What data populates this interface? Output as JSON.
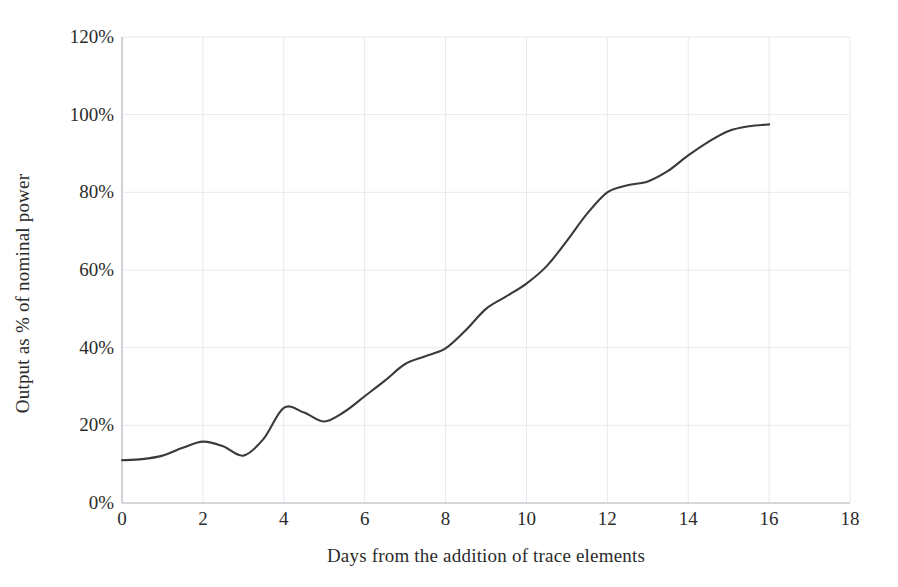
{
  "chart_data": {
    "type": "line",
    "title": "",
    "xlabel": "Days from the addition of trace elements",
    "ylabel": "Output as % of nominal power",
    "xlim": [
      0,
      18
    ],
    "ylim": [
      0,
      120
    ],
    "xticks": [
      "0",
      "2",
      "4",
      "6",
      "8",
      "10",
      "12",
      "14",
      "16",
      "18"
    ],
    "xtick_values": [
      0,
      2,
      4,
      6,
      8,
      10,
      12,
      14,
      16,
      18
    ],
    "yticks": [
      "0%",
      "20%",
      "40%",
      "60%",
      "80%",
      "100%",
      "120%"
    ],
    "ytick_values": [
      0,
      20,
      40,
      60,
      80,
      100,
      120
    ],
    "grid": true,
    "legend": "none",
    "line_color": "#3a3a3a",
    "grid_color": "#e8e8ee",
    "axis_color": "#c9c9d2",
    "background": "#ffffff",
    "series": [
      {
        "name": "Output as % of nominal power",
        "x": [
          0,
          0.5,
          1,
          1.5,
          2,
          2.5,
          3,
          3.5,
          4,
          4.5,
          5,
          5.5,
          6,
          6.5,
          7,
          7.5,
          8,
          8.5,
          9,
          9.5,
          10,
          10.5,
          11,
          11.5,
          12,
          12.5,
          13,
          13.5,
          14,
          14.5,
          15,
          15.5,
          16
        ],
        "values": [
          11,
          11.3,
          12.2,
          14.2,
          15.8,
          14.6,
          12.2,
          16.5,
          24.5,
          23.3,
          21,
          23.5,
          27.5,
          31.5,
          35.8,
          37.8,
          39.8,
          44.5,
          50,
          53.2,
          56.5,
          61,
          67.5,
          74.5,
          80,
          81.8,
          82.8,
          85.5,
          89.5,
          93,
          95.8,
          97,
          97.5
        ]
      }
    ]
  },
  "axes": {
    "y_title": "Output as % of nominal power",
    "x_title": "Days from the addition of trace elements"
  }
}
